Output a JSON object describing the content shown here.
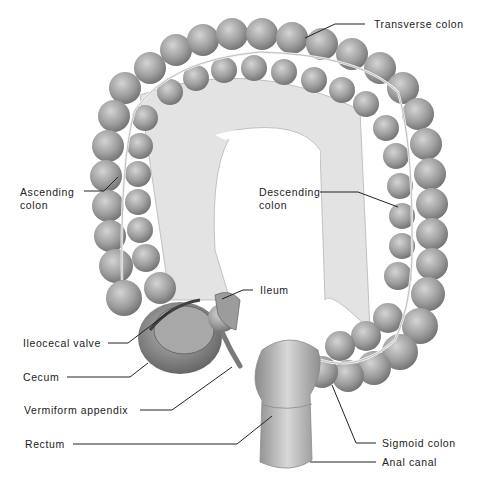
{
  "colors": {
    "tissue": "#9a9a9a",
    "tissue_light": "#c8c8c8",
    "tissue_dark": "#6f6f6f",
    "mesentery": "#e2e2e2",
    "vessel": "#f0f0f0",
    "label_text": "#222222"
  },
  "labels": [
    {
      "id": "transverse-colon",
      "text": "Transverse colon"
    },
    {
      "id": "ascending-colon",
      "text": "Ascending\ncolon",
      "line1": "Ascending",
      "line2": "colon"
    },
    {
      "id": "descending-colon",
      "text": "Descending\ncolon",
      "line1": "Descending",
      "line2": "colon"
    },
    {
      "id": "ileum",
      "text": "Ileum"
    },
    {
      "id": "ileocecal-valve",
      "text": "Ileocecal valve"
    },
    {
      "id": "cecum",
      "text": "Cecum"
    },
    {
      "id": "vermiform-appendix",
      "text": "Vermiform appendix"
    },
    {
      "id": "rectum",
      "text": "Rectum"
    },
    {
      "id": "sigmoid-colon",
      "text": "Sigmoid colon"
    },
    {
      "id": "anal-canal",
      "text": "Anal canal"
    }
  ]
}
